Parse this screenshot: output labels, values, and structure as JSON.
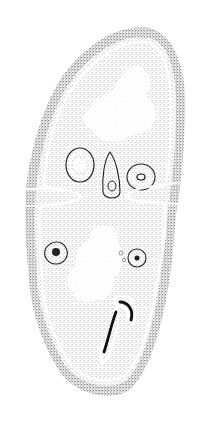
{
  "figure": {
    "kind": "stippled anatomical cross-section illustration",
    "caption": "",
    "colors": {
      "background": "#ffffff",
      "stipple_dark": "#1a1a1a",
      "stipple_mid": "#6b6b6b",
      "membrane": "#ffffff",
      "light_region": "#f4f4f4"
    },
    "structures": [
      {
        "name": "outer-cortex"
      },
      {
        "name": "white-membrane-line"
      },
      {
        "name": "upper-light-tissue"
      },
      {
        "name": "lower-light-tissue"
      },
      {
        "name": "left-oval-duct"
      },
      {
        "name": "center-tear-duct"
      },
      {
        "name": "right-oval-duct"
      },
      {
        "name": "left-small-duct"
      },
      {
        "name": "right-small-duct"
      },
      {
        "name": "coiled-duct"
      },
      {
        "name": "left-constriction"
      },
      {
        "name": "right-constriction"
      }
    ]
  }
}
